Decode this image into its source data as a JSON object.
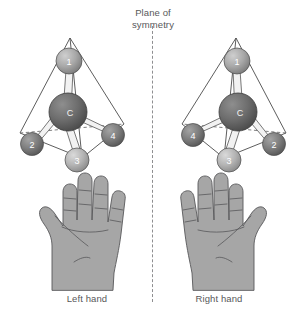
{
  "diagram": {
    "plane_label_line1": "Plane of",
    "plane_label_line2": "symmetry",
    "mirror_line_style": "dashed-vertical",
    "background_color": "#ffffff",
    "text_color": "#58585a"
  },
  "molecules": [
    {
      "id": "left-molecule",
      "center_atom_label": "C",
      "center_atom_color": "#6d6d6d",
      "substituents": [
        {
          "label": "1",
          "position": "top",
          "color": "#a8a8a8"
        },
        {
          "label": "2",
          "position": "lower-left",
          "color": "#7d7d7d"
        },
        {
          "label": "3",
          "position": "bottom-front",
          "color": "#b4b4b4"
        },
        {
          "label": "4",
          "position": "lower-right",
          "color": "#7d7d7d"
        }
      ]
    },
    {
      "id": "right-molecule",
      "center_atom_label": "C",
      "center_atom_color": "#6d6d6d",
      "substituents": [
        {
          "label": "1",
          "position": "top",
          "color": "#a8a8a8"
        },
        {
          "label": "4",
          "position": "lower-left",
          "color": "#7d7d7d"
        },
        {
          "label": "3",
          "position": "bottom-front",
          "color": "#b4b4b4"
        },
        {
          "label": "2",
          "position": "lower-right",
          "color": "#7d7d7d"
        }
      ]
    }
  ],
  "hands": [
    {
      "id": "left-hand",
      "caption": "Left hand",
      "thumb_side": "left",
      "fill_color": "#a6a6a6"
    },
    {
      "id": "right-hand",
      "caption": "Right hand",
      "thumb_side": "right",
      "fill_color": "#a6a6a6"
    }
  ]
}
